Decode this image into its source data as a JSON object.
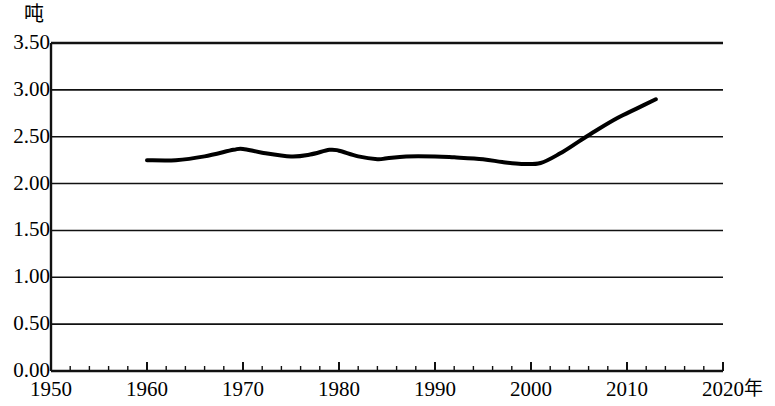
{
  "chart_data": {
    "type": "line",
    "title": "",
    "xlabel": "年",
    "ylabel": "吨",
    "xlim": [
      1950,
      2020
    ],
    "ylim": [
      0.0,
      3.5
    ],
    "grid": true,
    "legend": false,
    "y_ticks": [
      "0.00",
      "0.50",
      "1.00",
      "1.50",
      "2.00",
      "2.50",
      "3.00",
      "3.50"
    ],
    "y_tick_values": [
      0.0,
      0.5,
      1.0,
      1.5,
      2.0,
      2.5,
      3.0,
      3.5
    ],
    "x_ticks": [
      "1950",
      "1960",
      "1970",
      "1980",
      "1990",
      "2000",
      "2010",
      "2020"
    ],
    "x_tick_values": [
      1950,
      1960,
      1970,
      1980,
      1990,
      2000,
      2010,
      2020
    ],
    "x_minor_tick_step": 2,
    "line_color": "#000000",
    "line_width": 4,
    "series": [
      {
        "name": "",
        "x": [
          1960,
          1963,
          1966,
          1969,
          1970,
          1972,
          1975,
          1977,
          1979,
          1980,
          1982,
          1984,
          1985,
          1987,
          1990,
          1992,
          1995,
          1997,
          1999,
          2001,
          2003,
          2005,
          2007,
          2009,
          2011,
          2013
        ],
        "values": [
          2.25,
          2.25,
          2.29,
          2.36,
          2.37,
          2.33,
          2.29,
          2.31,
          2.36,
          2.35,
          2.29,
          2.26,
          2.27,
          2.29,
          2.29,
          2.28,
          2.26,
          2.23,
          2.21,
          2.22,
          2.32,
          2.45,
          2.58,
          2.7,
          2.8,
          2.9
        ]
      }
    ]
  },
  "axis": {
    "y_unit_label": "吨",
    "x_unit_label": "年"
  }
}
